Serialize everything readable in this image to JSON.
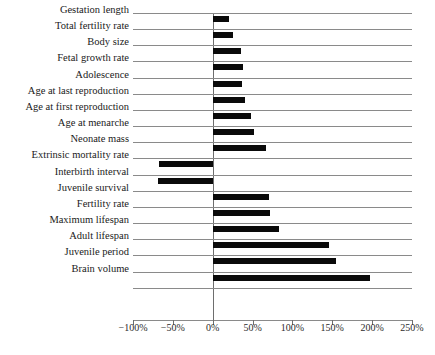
{
  "chart_data": {
    "type": "bar",
    "orientation": "horizontal",
    "title": "",
    "xlabel": "",
    "ylabel": "",
    "xlim": [
      -100,
      250
    ],
    "xticks": [
      -100,
      -50,
      0,
      50,
      100,
      150,
      200,
      250
    ],
    "xticklabels": [
      "-100%",
      "-50%",
      "0%",
      "50%",
      "100%",
      "150%",
      "200%",
      "250%"
    ],
    "grid": true,
    "grid_axis": "y",
    "legend": "none",
    "bar_color": "#0a0a0a",
    "zero_line": 0,
    "categories": [
      "Gestation length",
      "Total fertility rate",
      "Body size",
      "Fetal growth rate",
      "Adolescence",
      "Age at last reproduction",
      "Age at first reproduction",
      "Age at menarche",
      "Neonate mass",
      "Extrinsic mortality rate",
      "Interbirth interval",
      "Juvenile survival",
      "Fertility rate",
      "Maximum lifespan",
      "Adult lifespan",
      "Juvenile period",
      "Brain volume"
    ],
    "values": [
      21,
      26,
      35,
      38,
      37,
      41,
      48,
      52,
      67,
      -67,
      -69,
      71,
      72,
      83,
      146,
      155,
      197
    ]
  }
}
